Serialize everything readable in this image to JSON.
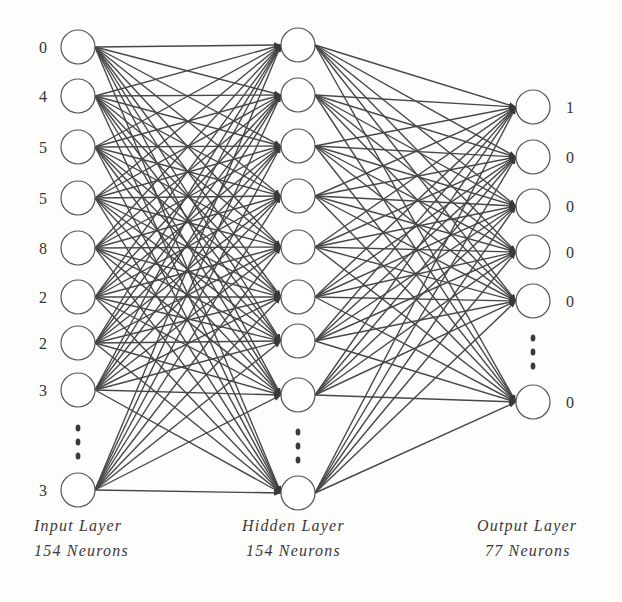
{
  "diagram": {
    "type": "feedforward-neural-network",
    "colors": {
      "edge": "#474747",
      "node_stroke": "#555555",
      "background": "#fdfdfc"
    },
    "layers": [
      {
        "id": "input",
        "title": "Input Layer",
        "subtitle": "154 Neurons",
        "x": 78,
        "label_side": "left",
        "nodes": [
          {
            "y": 47,
            "value": "0"
          },
          {
            "y": 96,
            "value": "4"
          },
          {
            "y": 147,
            "value": "5"
          },
          {
            "y": 198,
            "value": "5"
          },
          {
            "y": 248,
            "value": "8"
          },
          {
            "y": 297,
            "value": "2"
          },
          {
            "y": 343,
            "value": "2"
          },
          {
            "y": 390,
            "value": "3"
          },
          {
            "y": 490,
            "value": "3"
          }
        ],
        "ellipsis_y": [
          428,
          442,
          456
        ]
      },
      {
        "id": "hidden",
        "title": "Hidden Layer",
        "subtitle": "154 Neurons",
        "x": 298,
        "label_side": "none",
        "nodes": [
          {
            "y": 45,
            "value": ""
          },
          {
            "y": 95,
            "value": ""
          },
          {
            "y": 146,
            "value": ""
          },
          {
            "y": 196,
            "value": ""
          },
          {
            "y": 247,
            "value": ""
          },
          {
            "y": 297,
            "value": ""
          },
          {
            "y": 341,
            "value": ""
          },
          {
            "y": 395,
            "value": ""
          },
          {
            "y": 493,
            "value": ""
          }
        ],
        "ellipsis_y": [
          432,
          446,
          460
        ]
      },
      {
        "id": "output",
        "title": "Output Layer",
        "subtitle": "77 Neurons",
        "x": 533,
        "label_side": "right",
        "nodes": [
          {
            "y": 107,
            "value": "1"
          },
          {
            "y": 157,
            "value": "0"
          },
          {
            "y": 206,
            "value": "0"
          },
          {
            "y": 252,
            "value": "0"
          },
          {
            "y": 301,
            "value": "0"
          },
          {
            "y": 402,
            "value": "0"
          }
        ],
        "ellipsis_y": [
          338,
          352,
          366
        ]
      }
    ],
    "connections": "fully-connected-with-arrows"
  }
}
